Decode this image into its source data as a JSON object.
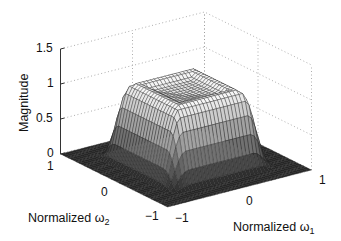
{
  "chart_data": {
    "type": "surface3d",
    "title": "",
    "xlabel": "Normalized ω1",
    "ylabel": "Normalized ω2",
    "zlabel": "Magnitude",
    "xlim": [
      -1,
      1
    ],
    "ylim": [
      -1,
      1
    ],
    "zlim": [
      0,
      1.5
    ],
    "x_ticks": [
      "-1",
      "0",
      "1"
    ],
    "y_ticks": [
      "-1",
      "0",
      "1"
    ],
    "z_ticks": [
      "0",
      "0.5",
      "1",
      "1.5"
    ],
    "grid": true,
    "colormap": "gray",
    "surface": {
      "passband_edge": 0.45,
      "stopband_edge": 0.75,
      "passband_level": 1.0,
      "rim_overshoot": 0.08,
      "grid_points": 41
    }
  },
  "labels": {
    "zlabel": "Magnitude",
    "xlabel_main": "Normalized ω",
    "xlabel_sub": "1",
    "ylabel_main": "Normalized ω",
    "ylabel_sub": "2",
    "z_ticks": [
      "1.5",
      "1",
      "0.5",
      "0"
    ],
    "x_ticks": [
      "-1",
      "0",
      "1"
    ],
    "y_ticks": [
      "1",
      "0",
      "-1"
    ]
  }
}
